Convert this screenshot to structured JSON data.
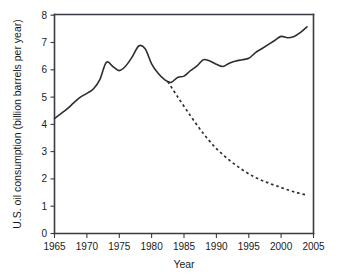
{
  "chart_data": {
    "type": "line",
    "title": "",
    "xlabel": "Year",
    "ylabel": "U.S. oil consumption (billion barrels per year)",
    "xlim": [
      1965,
      2005
    ],
    "ylim": [
      0,
      8
    ],
    "xticks": [
      1965,
      1970,
      1975,
      1980,
      1985,
      1990,
      1995,
      2000,
      2005
    ],
    "yticks": [
      0,
      1,
      2,
      3,
      4,
      5,
      6,
      7,
      8
    ],
    "grid": false,
    "legend": "none",
    "series": [
      {
        "name": "actual-consumption",
        "style": "solid",
        "color": "#2d2d35",
        "x": [
          1965,
          1966,
          1967,
          1968,
          1969,
          1970,
          1971,
          1972,
          1973,
          1974,
          1975,
          1976,
          1977,
          1978,
          1979,
          1980,
          1981,
          1982,
          1983,
          1984,
          1985,
          1986,
          1987,
          1988,
          1989,
          1990,
          1991,
          1992,
          1993,
          1994,
          1995,
          1996,
          1997,
          1998,
          1999,
          2000,
          2001,
          2002,
          2003,
          2004
        ],
        "values": [
          4.2,
          4.38,
          4.56,
          4.78,
          4.98,
          5.12,
          5.28,
          5.62,
          6.25,
          6.1,
          5.95,
          6.12,
          6.45,
          6.85,
          6.75,
          6.2,
          5.85,
          5.62,
          5.52,
          5.7,
          5.75,
          5.95,
          6.12,
          6.35,
          6.3,
          6.18,
          6.1,
          6.22,
          6.3,
          6.35,
          6.4,
          6.6,
          6.75,
          6.9,
          7.05,
          7.2,
          7.15,
          7.2,
          7.35,
          7.55
        ]
      },
      {
        "name": "projected-decline",
        "style": "dashed",
        "color": "#2d2d35",
        "x": [
          1982.5,
          1984,
          1986,
          1988,
          1990,
          1992,
          1994,
          1996,
          1998,
          2000,
          2002,
          2004
        ],
        "values": [
          5.55,
          5.0,
          4.3,
          3.65,
          3.1,
          2.68,
          2.33,
          2.05,
          1.85,
          1.68,
          1.52,
          1.4
        ]
      }
    ]
  },
  "axes": {
    "x_title": "Year",
    "y_title": "U.S. oil consumption (billion barrels per year)",
    "x_tick_labels": [
      "1965",
      "1970",
      "1975",
      "1980",
      "1985",
      "1990",
      "1995",
      "2000",
      "2005"
    ],
    "y_tick_labels": [
      "0",
      "1",
      "2",
      "3",
      "4",
      "5",
      "6",
      "7",
      "8"
    ]
  },
  "style": {
    "axis_color": "#3a3a45",
    "line_color": "#2d2d35",
    "background": "#ffffff"
  }
}
